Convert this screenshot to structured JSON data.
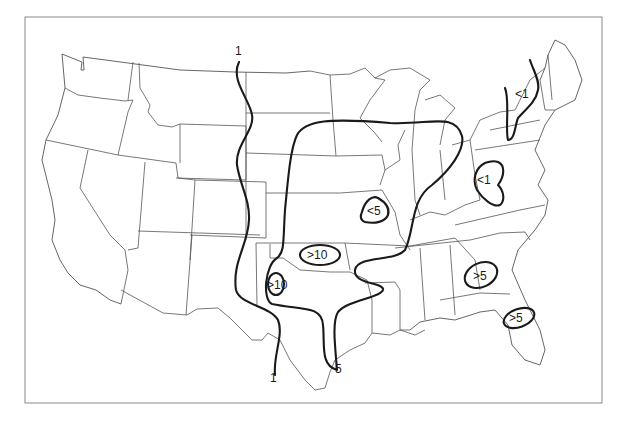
{
  "map": {
    "region": "Contiguous United States",
    "style": "black-and-white isoline map",
    "frame": {
      "x": 25,
      "y": 17,
      "width": 577,
      "height": 386,
      "color": "#8a8a8a"
    },
    "line_color": "#1a1a1a",
    "isolines": [
      {
        "id": "isoline-1",
        "value": "1",
        "labels": [
          {
            "text": "1",
            "x": 239,
            "y": 54
          },
          {
            "text": "1",
            "x": 272,
            "y": 383
          }
        ]
      },
      {
        "id": "isoline-5",
        "value": "5",
        "labels": [
          {
            "text": "5",
            "x": 336,
            "y": 372
          }
        ]
      }
    ],
    "region_labels": [
      {
        "id": "lt1-new-york",
        "text": "<1",
        "x": 523,
        "y": 97
      },
      {
        "id": "lt1-west-virginia",
        "text": "<1",
        "x": 484,
        "y": 182
      },
      {
        "id": "lt5-missouri",
        "text": "<5",
        "x": 375,
        "y": 215
      },
      {
        "id": "gt10-oklahoma",
        "text": ">10",
        "x": 322,
        "y": 257
      },
      {
        "id": "gt10-texas-panhandle",
        "text": ">10",
        "x": 278,
        "y": 287
      },
      {
        "id": "gt5-georgia",
        "text": ">5",
        "x": 480,
        "y": 276
      },
      {
        "id": "gt5-florida",
        "text": ">5",
        "x": 516,
        "y": 320
      }
    ]
  }
}
